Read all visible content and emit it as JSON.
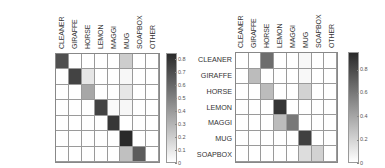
{
  "chart_data": [
    {
      "type": "heatmap",
      "title": "",
      "xlabel": "",
      "ylabel": "",
      "x_categories": [
        "CLEANER",
        "GIRAFFE",
        "HORSE",
        "LEMON",
        "MAGGI",
        "MUG",
        "SOAPBOX",
        "OTHER"
      ],
      "y_categories": [
        "CLEANER",
        "GIRAFFE",
        "HORSE",
        "LEMON",
        "MAGGI",
        "MUG",
        "SOAPBOX"
      ],
      "colorbar": {
        "min": 0,
        "max": 0.85,
        "ticks": [
          0,
          0.1,
          0.2,
          0.3,
          0.4,
          0.5,
          0.6,
          0.7,
          0.8
        ]
      },
      "values": [
        [
          0.7,
          0,
          0,
          0,
          0,
          0.2,
          0,
          0
        ],
        [
          0,
          0.75,
          0.1,
          0,
          0,
          0.03,
          0,
          0
        ],
        [
          0,
          0,
          0.35,
          0,
          0,
          0.1,
          0,
          0
        ],
        [
          0,
          0,
          0,
          0.75,
          0.02,
          0.03,
          0,
          0
        ],
        [
          0,
          0,
          0,
          0,
          0.8,
          0,
          0,
          0
        ],
        [
          0,
          0,
          0,
          0,
          0,
          0.85,
          0,
          0
        ],
        [
          0,
          0,
          0,
          0,
          0,
          0.25,
          0.65,
          0
        ]
      ]
    },
    {
      "type": "heatmap",
      "title": "",
      "xlabel": "",
      "ylabel": "",
      "x_categories": [
        "CLEANER",
        "GIRAFFE",
        "HORSE",
        "LEMON",
        "MAGGI",
        "MUG",
        "SOAPBOX",
        "OTHER"
      ],
      "y_categories": [
        "CLEANER",
        "GIRAFFE",
        "HORSE",
        "LEMON",
        "MAGGI",
        "MUG",
        "SOAPBOX"
      ],
      "colorbar": {
        "min": 0,
        "max": 0.95,
        "ticks": [
          0,
          0.2,
          0.4,
          0.6,
          0.8
        ]
      },
      "values": [
        [
          0,
          0,
          0.65,
          0,
          0,
          0.03,
          0,
          0
        ],
        [
          0,
          0.3,
          0,
          0,
          0,
          0.03,
          0,
          0
        ],
        [
          0,
          0,
          0.3,
          0,
          0,
          0.2,
          0,
          0
        ],
        [
          0,
          0,
          0,
          0.9,
          0,
          0,
          0,
          0
        ],
        [
          0,
          0,
          0,
          0.3,
          0.6,
          0,
          0,
          0
        ],
        [
          0,
          0,
          0,
          0,
          0,
          0.85,
          0,
          0
        ],
        [
          0,
          0,
          0,
          0,
          0,
          0.15,
          0.2,
          0
        ]
      ]
    }
  ],
  "panels": [
    {
      "col_labels": [
        "CLEANER",
        "GIRAFFE",
        "HORSE",
        "LEMON",
        "MAGGI",
        "MUG",
        "SOAPBOX",
        "OTHER"
      ],
      "row_labels": [
        "CLEANER",
        "GIRAFFE",
        "HORSE",
        "LEMON",
        "MAGGI",
        "MUG",
        "SOAPBOX"
      ],
      "tick_labels": [
        "0.8",
        "0.7",
        "0.6",
        "0.5",
        "0.4",
        "0.3",
        "0.2",
        "0.1",
        "0"
      ]
    },
    {
      "col_labels": [
        "CLEANER",
        "GIRAFFE",
        "HORSE",
        "LEMON",
        "MAGGI",
        "MUG",
        "SOAPBOX",
        "OTHER"
      ],
      "row_labels": [
        "CLEANER",
        "GIRAFFE",
        "HORSE",
        "LEMON",
        "MAGGI",
        "MUG",
        "SOAPBOX"
      ],
      "tick_labels": [
        "0.8",
        "0.6",
        "0.4",
        "0.2",
        "0"
      ]
    }
  ],
  "colors": {
    "low": "#ffffff",
    "high": "#2a2a2a"
  }
}
